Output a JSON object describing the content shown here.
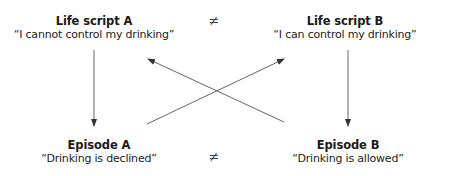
{
  "diagram": {
    "nodes": {
      "life_script_a": {
        "title": "Life script A",
        "quote": "“I cannot control my drinking”"
      },
      "life_script_b": {
        "title": "Life script B",
        "quote": "“I can control my drinking”"
      },
      "episode_a": {
        "title": "Episode A",
        "quote": "“Drinking is declined”"
      },
      "episode_b": {
        "title": "Episode B",
        "quote": "“Drinking is allowed”"
      }
    },
    "relations": {
      "top_neq": "≠",
      "bottom_neq": "≠"
    },
    "edges": [
      {
        "from": "life_script_a",
        "to": "episode_a",
        "type": "arrow"
      },
      {
        "from": "life_script_b",
        "to": "episode_b",
        "type": "arrow"
      },
      {
        "from": "episode_a",
        "to": "life_script_b",
        "type": "arrow"
      },
      {
        "from": "episode_b",
        "to": "life_script_a",
        "type": "arrow"
      }
    ],
    "colors": {
      "line": "#555555",
      "text": "#1a1a1a"
    }
  }
}
